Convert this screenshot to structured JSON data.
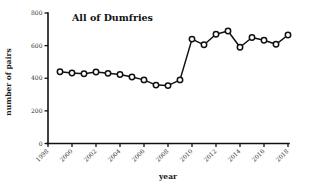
{
  "chart_data": {
    "type": "line",
    "title": "All of Dumfries",
    "xlabel": "year",
    "ylabel": "number of pairs",
    "xlim": [
      1998,
      2018
    ],
    "ylim": [
      0,
      800
    ],
    "xticks": [
      1998,
      2000,
      2002,
      2004,
      2006,
      2008,
      2010,
      2012,
      2014,
      2016,
      2018
    ],
    "yticks": [
      0,
      200,
      400,
      600,
      800
    ],
    "grid": false,
    "legend": "none",
    "marker": "open-circle",
    "x": [
      1999,
      2000,
      2001,
      2002,
      2003,
      2004,
      2005,
      2006,
      2007,
      2008,
      2009,
      2010,
      2011,
      2012,
      2013,
      2014,
      2015,
      2016,
      2017,
      2018
    ],
    "values": [
      440,
      432,
      428,
      438,
      430,
      423,
      408,
      390,
      358,
      355,
      390,
      640,
      605,
      670,
      690,
      590,
      650,
      633,
      608,
      665
    ],
    "series": [
      {
        "name": "number of pairs",
        "values": [
          440,
          432,
          428,
          438,
          430,
          423,
          408,
          390,
          358,
          355,
          390,
          640,
          605,
          670,
          690,
          590,
          650,
          633,
          608,
          665
        ]
      }
    ]
  },
  "axes": {
    "y_tick_labels": [
      "0",
      "200",
      "400",
      "600",
      "800"
    ],
    "x_tick_labels": [
      "1998",
      "2000",
      "2002",
      "2004",
      "2006",
      "2008",
      "2010",
      "2012",
      "2014",
      "2016",
      "2018"
    ]
  },
  "colors": {
    "line": "#111111",
    "marker_fill": "#ffffff",
    "axis": "#111111",
    "background": "#ffffff"
  }
}
